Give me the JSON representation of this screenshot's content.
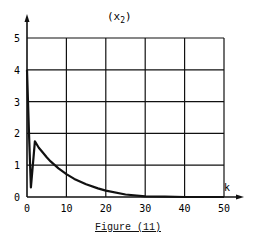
{
  "chart_data": {
    "type": "line",
    "title": "(x2)",
    "title_main": "(x",
    "title_sub": "2",
    "title_close": ")",
    "xlabel": "k",
    "ylabel": "",
    "xlim": [
      0,
      50
    ],
    "ylim": [
      0,
      5
    ],
    "grid": true,
    "x_ticks": [
      0,
      10,
      20,
      30,
      40,
      50
    ],
    "y_ticks": [
      0,
      1,
      2,
      3,
      4,
      5
    ],
    "series": [
      {
        "name": "x2",
        "x": [
          0,
          0.5,
          1,
          2,
          3,
          4,
          5,
          6,
          8,
          10,
          12,
          15,
          18,
          20,
          25,
          30,
          35,
          40,
          45,
          50
        ],
        "values": [
          4.0,
          2.0,
          0.3,
          1.75,
          1.55,
          1.4,
          1.25,
          1.12,
          0.9,
          0.72,
          0.57,
          0.4,
          0.27,
          0.2,
          0.08,
          0.02,
          0.01,
          0.0,
          0.0,
          0.0
        ]
      }
    ],
    "caption": "Figure (11)"
  }
}
